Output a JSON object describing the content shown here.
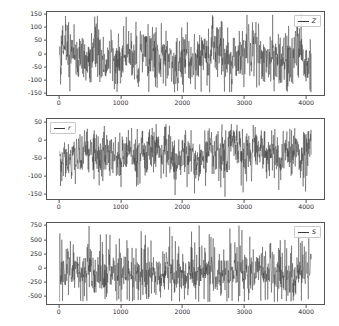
{
  "figure": {
    "background_color": "#ffffff",
    "line_color": "#3a3a3a",
    "axis_color": "#555555",
    "tick_label_color": "#2b2b2b"
  },
  "chart_data": [
    {
      "type": "line",
      "title": "",
      "xlabel": "",
      "ylabel": "",
      "legend": [
        "Z"
      ],
      "legend_position": "upper right",
      "grid": false,
      "xlim": [
        -205,
        4305
      ],
      "ylim": [
        -160,
        160
      ],
      "xticks": [
        0,
        1000,
        2000,
        3000,
        4000
      ],
      "xtick_labels": [
        "0",
        "1000",
        "2000",
        "3000",
        "4000"
      ],
      "yticks": [
        -150,
        -100,
        -50,
        0,
        50,
        100,
        150
      ],
      "ytick_labels": [
        "-150",
        "-100",
        "-50",
        "0",
        "50",
        "100",
        "150"
      ],
      "series": [
        {
          "name": "Z",
          "n_points": 4100,
          "x_start": 0,
          "x_end": 4100,
          "mean": -5,
          "noise_sd": 33,
          "burst_sd": 26,
          "spike_rate": 0.05,
          "spike_scale": 88,
          "clip": [
            -150,
            150
          ],
          "seed": 17
        }
      ]
    },
    {
      "type": "line",
      "title": "",
      "xlabel": "",
      "ylabel": "",
      "legend": [
        "r"
      ],
      "legend_position": "upper left",
      "grid": false,
      "xlim": [
        -205,
        4305
      ],
      "ylim": [
        -168,
        62
      ],
      "xticks": [
        0,
        1000,
        2000,
        3000,
        4000
      ],
      "xtick_labels": [
        "0",
        "1000",
        "2000",
        "3000",
        "4000"
      ],
      "yticks": [
        -150,
        -100,
        -50,
        0,
        50
      ],
      "ytick_labels": [
        "-150",
        "-100",
        "-50",
        "0",
        "50"
      ],
      "series": [
        {
          "name": "r",
          "n_points": 4100,
          "x_start": 0,
          "x_end": 4100,
          "mean": -38,
          "noise_sd": 19,
          "burst_sd": 14,
          "spike_rate": 0.045,
          "spike_scale": -72,
          "clip": [
            -162,
            48
          ],
          "seed": 91
        }
      ]
    },
    {
      "type": "line",
      "title": "",
      "xlabel": "",
      "ylabel": "",
      "legend": [
        "S"
      ],
      "legend_position": "upper right",
      "grid": false,
      "xlim": [
        -205,
        4305
      ],
      "ylim": [
        -660,
        810
      ],
      "xticks": [
        0,
        1000,
        2000,
        3000,
        4000
      ],
      "xtick_labels": [
        "0",
        "1000",
        "2000",
        "3000",
        "4000"
      ],
      "yticks": [
        -500,
        -250,
        0,
        250,
        500,
        750
      ],
      "ytick_labels": [
        "-500",
        "-250",
        "0",
        "250",
        "500",
        "750"
      ],
      "series": [
        {
          "name": "S",
          "n_points": 4100,
          "x_start": 0,
          "x_end": 4100,
          "mean": -110,
          "noise_sd": 95,
          "burst_sd": 60,
          "spike_rate": 0.18,
          "spike_scale": 560,
          "clip": [
            -620,
            770
          ],
          "seed": 305
        }
      ]
    }
  ],
  "panels": [
    {
      "id": "panel-z",
      "legend_label": "Z",
      "legend_position": "upper right",
      "ytick_labels": [
        "150",
        "100",
        "50",
        "0",
        "-50",
        "-100",
        "-150"
      ],
      "xtick_labels": [
        "0",
        "1000",
        "2000",
        "3000",
        "4000"
      ]
    },
    {
      "id": "panel-r",
      "legend_label": "r",
      "legend_position": "upper left",
      "ytick_labels": [
        "50",
        "0",
        "-50",
        "-100",
        "-150"
      ],
      "xtick_labels": [
        "0",
        "1000",
        "2000",
        "3000",
        "4000"
      ]
    },
    {
      "id": "panel-s",
      "legend_label": "S",
      "legend_position": "upper right",
      "ytick_labels": [
        "750",
        "500",
        "250",
        "0",
        "-250",
        "-500"
      ],
      "xtick_labels": [
        "0",
        "1000",
        "2000",
        "3000",
        "4000"
      ]
    }
  ]
}
